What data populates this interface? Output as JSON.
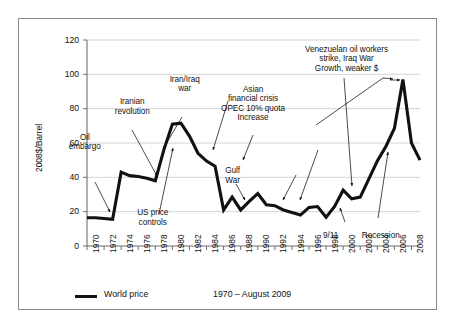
{
  "chart_data": {
    "type": "line",
    "title": "",
    "xlabel": "",
    "ylabel": "2008$/Barrel",
    "xlim": [
      1970,
      2009
    ],
    "ylim": [
      0,
      120
    ],
    "grid": true,
    "legend_position": "bottom-left",
    "series": [
      {
        "name": "World price",
        "color": "#111111",
        "x": [
          1970,
          1971,
          1972,
          1973,
          1974,
          1975,
          1976,
          1977,
          1978,
          1979,
          1980,
          1981,
          1982,
          1983,
          1984,
          1985,
          1986,
          1987,
          1988,
          1989,
          1990,
          1991,
          1992,
          1993,
          1994,
          1995,
          1996,
          1997,
          1998,
          1999,
          2000,
          2001,
          2002,
          2003,
          2004,
          2005,
          2006,
          2007,
          2008,
          2009
        ],
        "values": [
          16.5,
          16.5,
          16.0,
          15.5,
          43.0,
          41.0,
          40.5,
          39.5,
          38.0,
          56.0,
          71.0,
          71.5,
          64.0,
          54.0,
          49.5,
          46.5,
          21.0,
          28.5,
          21.0,
          26.0,
          30.5,
          24.0,
          23.5,
          21.0,
          19.5,
          18.0,
          22.5,
          23.0,
          16.8,
          23.0,
          32.5,
          27.5,
          28.5,
          39.0,
          49.5,
          58.0,
          68.5,
          97.0,
          60.0,
          50.0
        ]
      }
    ],
    "y_ticks": [
      0,
      20,
      40,
      60,
      80,
      100,
      120
    ],
    "x_ticks": [
      1970,
      1972,
      1974,
      1976,
      1978,
      1980,
      1982,
      1984,
      1986,
      1988,
      1990,
      1992,
      1994,
      1996,
      1998,
      2000,
      2002,
      2004,
      2006,
      2008
    ],
    "annotations": [
      {
        "id": "oil-embargo",
        "text": "Oil\nembargo",
        "x_pct": 18.6,
        "y_pct": 40.0
      },
      {
        "id": "iranian-revolution",
        "text": "Iranian\nrevolution",
        "x_pct": 29.0,
        "y_pct": 29.2
      },
      {
        "id": "iran-iraq-war",
        "text": "Iran/Iraq\nwar",
        "x_pct": 40.5,
        "y_pct": 22.5
      },
      {
        "id": "us-price-controls",
        "text": "US price\ncontrols",
        "x_pct": 33.5,
        "y_pct": 62.8
      },
      {
        "id": "asian-financial-crisis",
        "text": "Asian\nfinancial crisis\nOPEC 10% quota\nIncrease",
        "x_pct": 55.5,
        "y_pct": 25.5
      },
      {
        "id": "gulf-war",
        "text": "Gulf\nWar",
        "x_pct": 51.0,
        "y_pct": 50.0
      },
      {
        "id": "venezuelan-strike",
        "text": "Venezuelan oil workers\nstrike, Iraq War\nGrowth, weaker $",
        "x_pct": 76.0,
        "y_pct": 13.5
      },
      {
        "id": "nine-eleven",
        "text": "9/11",
        "x_pct": 72.5,
        "y_pct": 69.5
      },
      {
        "id": "recession",
        "text": "Recession",
        "x_pct": 83.5,
        "y_pct": 69.5
      }
    ]
  },
  "legend": {
    "series_label": "World price",
    "range_label": "1970 – August 2009"
  },
  "axes": {
    "y_title": "2008$/Barrel",
    "y_tick_labels": [
      "120",
      "100",
      "80",
      "60",
      "40",
      "20",
      "0"
    ],
    "x_tick_labels": [
      "1970",
      "1972",
      "1974",
      "1976",
      "1978",
      "1980",
      "1982",
      "1984",
      "1986",
      "1988",
      "1990",
      "1992",
      "1994",
      "1996",
      "1998",
      "2000",
      "2002",
      "2004",
      "2006",
      "2008"
    ]
  },
  "annotation_text": {
    "oil_embargo": "Oil\nembargo",
    "iranian_revolution": "Iranian\nrevolution",
    "iran_iraq_war": "Iran/Iraq\nwar",
    "us_price_controls": "US price\ncontrols",
    "asian_crisis": "Asian\nfinancial crisis\nOPEC 10% quota\nIncrease",
    "gulf_war": "Gulf\nWar",
    "venezuela": "Venezuelan oil workers\nstrike, Iraq War\nGrowth, weaker $",
    "nine_eleven": "9/11",
    "recession": "Recession"
  },
  "colors": {
    "line": "#111111",
    "grid": "#c9c9c9",
    "axis": "#6f6f6f",
    "frame": "#8a8a8a",
    "text": "#111111"
  }
}
